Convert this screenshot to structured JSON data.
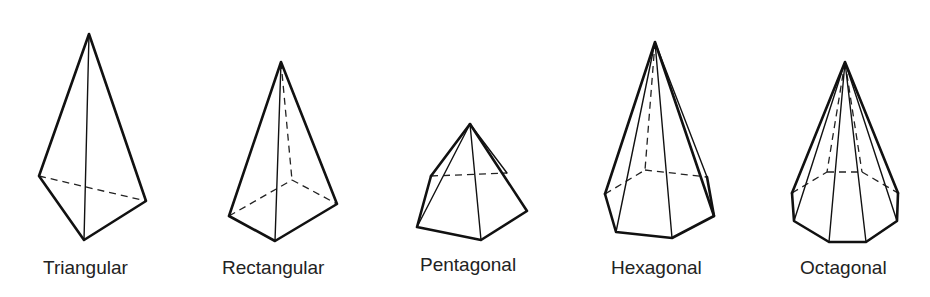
{
  "figure": {
    "pyramids": [
      {
        "label": "Triangular"
      },
      {
        "label": "Rectangular"
      },
      {
        "label": "Pentagonal"
      },
      {
        "label": "Hexagonal"
      },
      {
        "label": "Octagonal"
      }
    ]
  }
}
